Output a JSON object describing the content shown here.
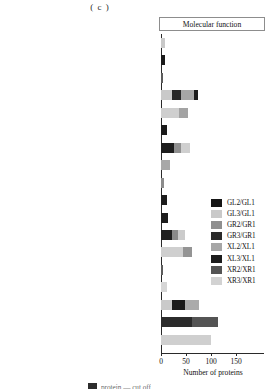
{
  "panel": {
    "caption": "( c )"
  },
  "chart_data": {
    "type": "bar",
    "orientation": "horizontal",
    "stacked": true,
    "title": "Molecular function",
    "xlabel": "Number of proteins",
    "ylabel": "",
    "xlim": [
      0,
      180
    ],
    "xticks": [
      0,
      50,
      100,
      150
    ],
    "xticklabels": [
      "0",
      "50",
      "100",
      "150"
    ],
    "grid": false,
    "legend_position": "center-right",
    "categories": [
      "tetrapyrrole binding",
      "pyrophosphatase activity",
      "oxidoreductase activity, acting on single donors with incorporation of molecular oxygen",
      "oxidoreductase activity",
      "organic cyclic compound binding",
      "nucleoside-triphosphatase activity",
      "metal ion binding",
      "ion binding",
      "hydrolase activityacting on glycosyl bonds",
      "hydrolase activityacting on acid anhydrides",
      "hydrolase activity,hydrolyzing O-glycosyl compounds",
      "hydrolase activity",
      "heterocyclic copper ion binding",
      "copper ion binding",
      "cofactor binding",
      "cation binding",
      "catalytic activity",
      "binding"
    ],
    "category_lines": [
      [
        "tetrapyrrole binding"
      ],
      [
        "pyrophosphatase activity"
      ],
      [
        "oxidoreductase activity, acting on single donors",
        "with incorporation of molecular oxygen"
      ],
      [
        "oxidoreductase activity"
      ],
      [
        "organic cyclic compound binding"
      ],
      [
        "nucleoside-triphosphatase activity"
      ],
      [
        "metal ion binding"
      ],
      [
        "ion binding"
      ],
      [
        "hydrolase activityacting on glycosyl bonds"
      ],
      [
        "hydrolase activityacting on acid anhydrides"
      ],
      [
        "hydrolase activity,hydrolyzing",
        "O-glycosyl compounds"
      ],
      [
        "hydrolase activity"
      ],
      [
        "heterocyclic copper ion binding"
      ],
      [
        "copper ion binding"
      ],
      [
        "cofactor binding"
      ],
      [
        "cation binding"
      ],
      [
        "catalytic activity"
      ],
      [
        "binding"
      ]
    ],
    "series": [
      {
        "name": "GL2/GL1",
        "color": "#161616",
        "values": [
          0,
          8,
          0,
          0,
          0,
          8,
          18,
          0,
          0,
          7,
          7,
          18,
          0,
          0,
          0,
          0,
          62,
          0
        ]
      },
      {
        "name": "GL3/GL1",
        "color": "#c9c9c9",
        "values": [
          8,
          0,
          0,
          22,
          0,
          0,
          0,
          0,
          0,
          0,
          0,
          0,
          0,
          0,
          0,
          22,
          0,
          0
        ]
      },
      {
        "name": "GR2/GR1",
        "color": "#8f8f8f",
        "values": [
          0,
          0,
          0,
          0,
          0,
          0,
          0,
          0,
          0,
          0,
          0,
          0,
          0,
          0,
          0,
          0,
          0,
          0
        ]
      },
      {
        "name": "GR3/GR1",
        "color": "#2b2b2b",
        "values": [
          0,
          0,
          0,
          18,
          0,
          0,
          0,
          0,
          0,
          0,
          0,
          0,
          0,
          0,
          0,
          26,
          34,
          0
        ]
      },
      {
        "name": "XL2/XL1",
        "color": "#a6a6a6",
        "values": [
          0,
          0,
          0,
          24,
          28,
          0,
          24,
          0,
          0,
          0,
          0,
          22,
          0,
          0,
          0,
          28,
          0,
          0
        ]
      },
      {
        "name": "XL3/XL1",
        "color": "#1c1c1c",
        "values": [
          0,
          0,
          0,
          6,
          0,
          0,
          0,
          0,
          0,
          0,
          0,
          0,
          0,
          0,
          0,
          0,
          0,
          0
        ]
      },
      {
        "name": "XR2/XR1",
        "color": "#545454",
        "values": [
          0,
          0,
          0,
          0,
          0,
          0,
          0,
          0,
          0,
          0,
          0,
          0,
          0,
          0,
          0,
          0,
          52,
          0
        ]
      },
      {
        "name": "XR3/XR1",
        "color": "#d2d2d2",
        "values": [
          0,
          0,
          5,
          0,
          14,
          0,
          0,
          14,
          4,
          0,
          0,
          0,
          44,
          2,
          9,
          0,
          0,
          100
        ]
      }
    ],
    "stack_order_note": "segments drawn left-to-right per bar",
    "bars": [
      {
        "category": "tetrapyrrole binding",
        "total": 8,
        "segments": [
          {
            "name": "GL3/GL1",
            "color": "#c9c9c9",
            "value": 8
          }
        ]
      },
      {
        "category": "pyrophosphatase activity",
        "total": 8,
        "segments": [
          {
            "name": "GL2/GL1",
            "color": "#1a1a1a",
            "value": 8
          }
        ]
      },
      {
        "category": "oxidoreductase activity, acting on single donors with incorporation of molecular oxygen",
        "total": 4,
        "segments": [
          {
            "name": "XR2/XR1",
            "color": "#5c5c5c",
            "value": 4
          }
        ]
      },
      {
        "category": "oxidoreductase activity",
        "total": 74,
        "segments": [
          {
            "name": "GL3/GL1",
            "color": "#c9c9c9",
            "value": 22
          },
          {
            "name": "GR3/GR1",
            "color": "#272727",
            "value": 18
          },
          {
            "name": "XL2/XL1",
            "color": "#a6a6a6",
            "value": 26
          },
          {
            "name": "XL3/XL1",
            "color": "#1c1c1c",
            "value": 8
          }
        ]
      },
      {
        "category": "organic cyclic compound binding",
        "total": 54,
        "segments": [
          {
            "name": "GL3/GL1",
            "color": "#cfcfcf",
            "value": 36
          },
          {
            "name": "XL2/XL1",
            "color": "#a3a3a3",
            "value": 18
          }
        ]
      },
      {
        "category": "nucleoside-triphosphatase activity",
        "total": 12,
        "segments": [
          {
            "name": "GL2/GL1",
            "color": "#1a1a1a",
            "value": 12
          }
        ]
      },
      {
        "category": "metal ion binding",
        "total": 58,
        "segments": [
          {
            "name": "GL2/GL1",
            "color": "#1d1d1d",
            "value": 26
          },
          {
            "name": "GR2/GR1",
            "color": "#8f8f8f",
            "value": 14
          },
          {
            "name": "XR3/XR1",
            "color": "#cfcfcf",
            "value": 18
          }
        ]
      },
      {
        "category": "ion binding",
        "total": 18,
        "segments": [
          {
            "name": "XL2/XL1",
            "color": "#a8a8a8",
            "value": 18
          }
        ]
      },
      {
        "category": "hydrolase activityacting on glycosyl bonds",
        "total": 6,
        "segments": [
          {
            "name": "GR2/GR1",
            "color": "#8c8c8c",
            "value": 6
          }
        ]
      },
      {
        "category": "hydrolase activityacting on acid anhydrides",
        "total": 12,
        "segments": [
          {
            "name": "GL2/GL1",
            "color": "#1d1d1d",
            "value": 12
          }
        ]
      },
      {
        "category": "hydrolase activity,hydrolyzing O-glycosyl compounds",
        "total": 14,
        "segments": [
          {
            "name": "GL2/GL1",
            "color": "#1d1d1d",
            "value": 14
          }
        ]
      },
      {
        "category": "hydrolase activity",
        "total": 48,
        "segments": [
          {
            "name": "GL2/GL1",
            "color": "#1f1f1f",
            "value": 22
          },
          {
            "name": "GR2/GR1",
            "color": "#8a8a8a",
            "value": 12
          },
          {
            "name": "XR3/XR1",
            "color": "#cbcbcb",
            "value": 14
          }
        ]
      },
      {
        "category": "heterocyclic copper ion binding",
        "total": 62,
        "segments": [
          {
            "name": "XR3/XR1",
            "color": "#cfcfcf",
            "value": 44
          },
          {
            "name": "GR2/GR1",
            "color": "#949494",
            "value": 18
          }
        ]
      },
      {
        "category": "copper ion binding",
        "total": 3,
        "segments": [
          {
            "name": "XR2/XR1",
            "color": "#5c5c5c",
            "value": 3
          }
        ]
      },
      {
        "category": "cofactor binding",
        "total": 12,
        "segments": [
          {
            "name": "XR3/XR1",
            "color": "#d6d6d6",
            "value": 12
          }
        ]
      },
      {
        "category": "cation binding",
        "total": 76,
        "segments": [
          {
            "name": "GL3/GL1",
            "color": "#cacaca",
            "value": 22
          },
          {
            "name": "GR3/GR1",
            "color": "#1b1b1b",
            "value": 26
          },
          {
            "name": "XL2/XL1",
            "color": "#ababab",
            "value": 28
          }
        ]
      },
      {
        "category": "catalytic activity",
        "total": 114,
        "segments": [
          {
            "name": "GL2/GL1",
            "color": "#2b2b2b",
            "value": 62
          },
          {
            "name": "XR2/XR1",
            "color": "#545454",
            "value": 52
          }
        ]
      },
      {
        "category": "binding",
        "total": 100,
        "segments": [
          {
            "name": "XR3/XR1",
            "color": "#cfcfcf",
            "value": 100
          }
        ]
      }
    ],
    "legend": [
      {
        "label": "GL2/GL1",
        "color": "#161616"
      },
      {
        "label": "GL3/GL1",
        "color": "#c9c9c9"
      },
      {
        "label": "GR2/GR1",
        "color": "#8f8f8f"
      },
      {
        "label": "GR3/GR1",
        "color": "#2b2b2b"
      },
      {
        "label": "XL2/XL1",
        "color": "#a6a6a6"
      },
      {
        "label": "XL3/XL1",
        "color": "#1c1c1c"
      },
      {
        "label": "XR2/XR1",
        "color": "#545454"
      },
      {
        "label": "XR3/XR1",
        "color": "#d2d2d2"
      }
    ]
  },
  "bottom_strip": {
    "text": "protein — cut off"
  }
}
